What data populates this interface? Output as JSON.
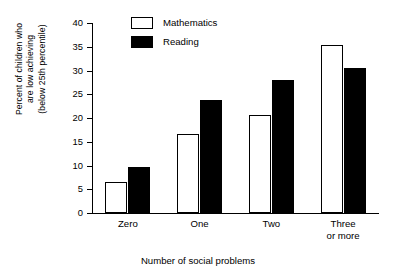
{
  "chart_data": {
    "type": "bar",
    "title": "",
    "xlabel": "Number of social problems",
    "ylabel": "Percent of children who are low achieving (below 25th percentile)",
    "ylabel_lines": [
      "Percent of children who",
      "are low achieving",
      "(below 25th percentile)"
    ],
    "categories": [
      "Zero",
      "One",
      "Two",
      "Three or more"
    ],
    "category_lines": [
      [
        "Zero"
      ],
      [
        "One"
      ],
      [
        "Two"
      ],
      [
        "Three",
        "or more"
      ]
    ],
    "series": [
      {
        "name": "Mathematics",
        "values": [
          6.6,
          16.6,
          20.7,
          35.4
        ],
        "color": "#ffffff",
        "edge": "#000000"
      },
      {
        "name": "Reading",
        "values": [
          9.7,
          23.8,
          28.1,
          30.5
        ],
        "color": "#000000",
        "edge": "#000000"
      }
    ],
    "ylim": [
      0,
      40
    ],
    "yticks": [
      0,
      5,
      10,
      15,
      20,
      25,
      30,
      35,
      40
    ],
    "ytick_labels": [
      "0",
      "5",
      "10",
      "15",
      "20",
      "25",
      "30",
      "35",
      "40"
    ],
    "grid": false,
    "legend_position": "top-left-inside"
  },
  "legend": {
    "items": [
      {
        "label": "Mathematics",
        "swatch": "open-square-swatch"
      },
      {
        "label": "Reading",
        "swatch": "filled-square-swatch"
      }
    ]
  }
}
